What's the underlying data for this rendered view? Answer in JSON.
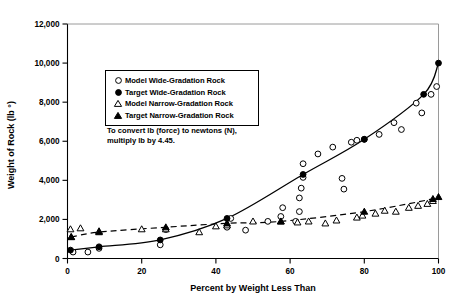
{
  "chart_data": {
    "type": "scatter",
    "title": "",
    "xlabel": "Percent by Weight Less Than",
    "ylabel": "Weight of Rock (lb °)",
    "xlim": [
      0,
      100
    ],
    "ylim": [
      0,
      12000
    ],
    "xticks": [
      0,
      20,
      40,
      60,
      80,
      100
    ],
    "xtick_labels": [
      "0",
      "20",
      "40",
      "60",
      "80",
      "100"
    ],
    "yticks": [
      0,
      2000,
      4000,
      6000,
      8000,
      10000,
      12000
    ],
    "ytick_labels": [
      "0",
      "2,000",
      "4,000",
      "6,000",
      "8,000",
      "10,000",
      "12,000"
    ],
    "grid": false,
    "legend_position": "upper-left-inside",
    "annotation": "To convert lb (force) to newtons (N), multiply lb by 4.45.",
    "series": [
      {
        "name": "Model Wide-Gradation Rock",
        "marker": "open-circle",
        "line": "none",
        "points": [
          [
            1.5,
            330
          ],
          [
            5.5,
            330
          ],
          [
            8.5,
            520
          ],
          [
            25.0,
            700
          ],
          [
            26.5,
            1480
          ],
          [
            43.0,
            1600
          ],
          [
            44.0,
            2050
          ],
          [
            48.0,
            1450
          ],
          [
            54.0,
            1900
          ],
          [
            57.5,
            2150
          ],
          [
            58.0,
            2600
          ],
          [
            61.5,
            1900
          ],
          [
            62.5,
            2400
          ],
          [
            62.5,
            3100
          ],
          [
            63.0,
            3600
          ],
          [
            63.5,
            4150
          ],
          [
            63.5,
            4850
          ],
          [
            67.5,
            5350
          ],
          [
            71.5,
            5700
          ],
          [
            74.0,
            4100
          ],
          [
            74.5,
            3550
          ],
          [
            76.5,
            5950
          ],
          [
            78.0,
            6050
          ],
          [
            80.0,
            6100
          ],
          [
            84.0,
            6350
          ],
          [
            88.0,
            6950
          ],
          [
            90.0,
            6600
          ],
          [
            94.0,
            7950
          ],
          [
            95.5,
            7450
          ],
          [
            98.0,
            8400
          ],
          [
            99.5,
            8800
          ]
        ]
      },
      {
        "name": "Target Wide-Gradation Rock",
        "marker": "filled-circle",
        "line": "solid",
        "points": [
          [
            0.8,
            430
          ],
          [
            8.5,
            600
          ],
          [
            25.0,
            950
          ],
          [
            43.0,
            2050
          ],
          [
            63.5,
            4300
          ],
          [
            80.0,
            6100
          ],
          [
            96.0,
            8400
          ],
          [
            100.0,
            10000
          ]
        ]
      },
      {
        "name": "Model Narrow-Gradation Rock",
        "marker": "open-triangle",
        "line": "none",
        "points": [
          [
            0.8,
            1500
          ],
          [
            1.0,
            1100
          ],
          [
            3.5,
            1550
          ],
          [
            8.5,
            1400
          ],
          [
            20.0,
            1500
          ],
          [
            26.5,
            1500
          ],
          [
            35.5,
            1350
          ],
          [
            40.0,
            1650
          ],
          [
            43.0,
            1700
          ],
          [
            50.0,
            1900
          ],
          [
            57.5,
            1900
          ],
          [
            62.0,
            1850
          ],
          [
            65.0,
            1900
          ],
          [
            69.5,
            1800
          ],
          [
            72.5,
            1950
          ],
          [
            78.0,
            2100
          ],
          [
            79.5,
            2200
          ],
          [
            83.0,
            2300
          ],
          [
            85.5,
            2450
          ],
          [
            88.5,
            2400
          ],
          [
            92.0,
            2600
          ],
          [
            94.5,
            2700
          ],
          [
            97.0,
            2800
          ],
          [
            98.5,
            2950
          ]
        ]
      },
      {
        "name": "Target Narrow-Gradation Rock",
        "marker": "filled-triangle",
        "line": "dashed",
        "points": [
          [
            1.0,
            1100
          ],
          [
            8.5,
            1350
          ],
          [
            26.5,
            1600
          ],
          [
            43.0,
            1800
          ],
          [
            57.5,
            1900
          ],
          [
            80.0,
            2400
          ],
          [
            98.5,
            3050
          ],
          [
            100.0,
            3150
          ]
        ]
      }
    ]
  },
  "legend": {
    "items": [
      {
        "label": "Model Wide-Gradation Rock",
        "marker": "open-circle"
      },
      {
        "label": "Target Wide-Gradation Rock",
        "marker": "filled-circle"
      },
      {
        "label": "Model Narrow-Gradation Rock",
        "marker": "open-triangle"
      },
      {
        "label": "Target Narrow-Gradation Rock",
        "marker": "filled-triangle"
      }
    ]
  },
  "note": {
    "line1": "To convert lb (force) to newtons (N),",
    "line2": "multiply lb by 4.45."
  },
  "colors": {
    "axis": "#000000",
    "marker": "#000000",
    "background": "#ffffff"
  }
}
